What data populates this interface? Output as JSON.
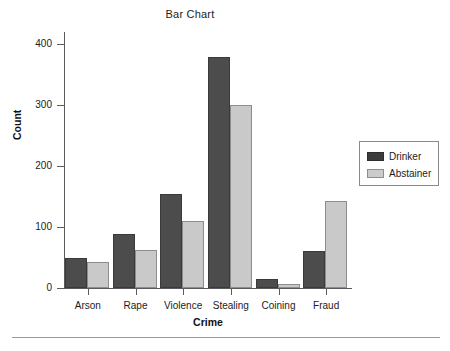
{
  "chart_data": {
    "type": "bar",
    "title": "Bar Chart",
    "xlabel": "Crime",
    "ylabel": "Count",
    "categories": [
      "Arson",
      "Rape",
      "Violence",
      "Stealing",
      "Coining",
      "Fraud"
    ],
    "series": [
      {
        "name": "Drinker",
        "color": "#4c4c4c",
        "values": [
          50,
          88,
          155,
          379,
          14,
          60
        ]
      },
      {
        "name": "Abstainer",
        "color": "#c9c9c9",
        "values": [
          43,
          62,
          110,
          300,
          7,
          142
        ]
      }
    ],
    "ylim": [
      0,
      420
    ],
    "yticks": [
      0,
      100,
      200,
      300,
      400
    ],
    "ytick_labels": [
      "0",
      "100",
      "200",
      "300",
      "400"
    ],
    "grid": false,
    "legend_position": "right-outside"
  },
  "legend": {
    "entries": [
      {
        "label": "Drinker"
      },
      {
        "label": "Abstainer"
      }
    ]
  }
}
